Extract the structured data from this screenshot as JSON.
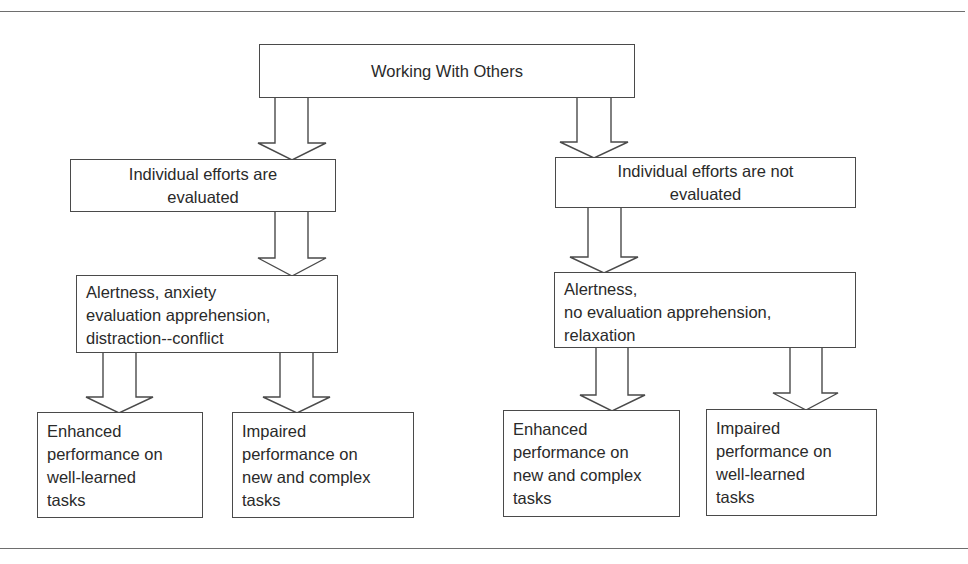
{
  "diagram": {
    "root": {
      "lines": [
        "Working With Others"
      ]
    },
    "branches": [
      {
        "condition": {
          "lines": [
            "Individual efforts are",
            "evaluated"
          ]
        },
        "state": {
          "lines": [
            "Alertness, anxiety",
            "evaluation apprehension,",
            "distraction--conflict"
          ]
        },
        "outcomes": [
          {
            "lines": [
              "Enhanced",
              "performance on",
              "well-learned",
              "tasks"
            ]
          },
          {
            "lines": [
              "Impaired",
              "performance on",
              "new and complex",
              "tasks"
            ]
          }
        ]
      },
      {
        "condition": {
          "lines": [
            "Individual efforts are not",
            "evaluated"
          ]
        },
        "state": {
          "lines": [
            "Alertness,",
            "no evaluation apprehension,",
            "relaxation"
          ]
        },
        "outcomes": [
          {
            "lines": [
              "Enhanced",
              "performance on",
              "new and complex",
              "tasks"
            ]
          },
          {
            "lines": [
              "Impaired",
              "performance on",
              "well-learned",
              "tasks"
            ]
          }
        ]
      }
    ],
    "colors": {
      "line": "#4a4a4a",
      "text": "#2a2a2a",
      "background": "#ffffff",
      "rule": "#6e6e6e"
    }
  }
}
